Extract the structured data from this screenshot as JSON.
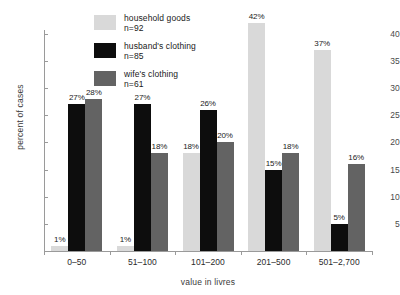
{
  "chart_data": {
    "type": "bar",
    "title": "",
    "xlabel": "value in livres",
    "ylabel": "percent of cases",
    "categories": [
      "0–50",
      "51–100",
      "101–200",
      "201–500",
      "501–2,700"
    ],
    "series": [
      {
        "name": "household goods",
        "legend_count": "n=92",
        "color": "#d9d9d9",
        "values": [
          1,
          1,
          18,
          42,
          37
        ],
        "labels": [
          "1%",
          "1%",
          "18%",
          "42%",
          "37%"
        ]
      },
      {
        "name": "husband's clothing",
        "legend_count": "n=85",
        "color": "#0d0d0d",
        "values": [
          27,
          27,
          26,
          15,
          5
        ],
        "labels": [
          "27%",
          "27%",
          "26%",
          "15%",
          "5%"
        ]
      },
      {
        "name": "wife's clothing",
        "legend_count": "n=61",
        "color": "#636363",
        "values": [
          28,
          18,
          20,
          18,
          16
        ],
        "labels": [
          "28%",
          "18%",
          "20%",
          "18%",
          "16%"
        ]
      }
    ],
    "yticks": [
      5,
      10,
      15,
      20,
      25,
      30,
      35,
      40
    ],
    "ytick_labels": [
      "5",
      "10",
      "15",
      "20",
      "25",
      "30",
      "35",
      "40"
    ],
    "ylim": [
      0,
      41
    ],
    "grid": false,
    "legend_position": "top-center"
  }
}
